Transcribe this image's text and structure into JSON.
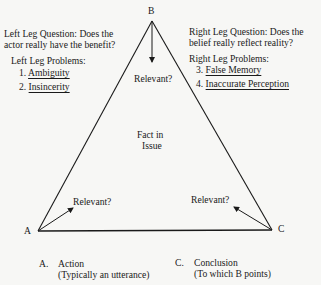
{
  "vertices": {
    "b": "B",
    "a": "A",
    "c": "C"
  },
  "left_leg": {
    "question_line1": "Left Leg Question:  Does the",
    "question_line2": "actor really have the benefit?",
    "problems_heading": "Left Leg Problems:",
    "problems": [
      {
        "num": "1.",
        "label": "Ambiguity"
      },
      {
        "num": "2.",
        "label": "Insincerity"
      }
    ]
  },
  "right_leg": {
    "question_line1": "Right Leg Question:  Does the",
    "question_line2": "belief really reflect reality?",
    "problems_heading": "Right Leg Problems:",
    "problems": [
      {
        "num": "3.",
        "label": "False Memory"
      },
      {
        "num": "4.",
        "label": "Inaccurate Perception"
      }
    ]
  },
  "relevance_labels": {
    "top": "Relevant?",
    "left": "Relevant?",
    "right": "Relevant?"
  },
  "center": {
    "line1": "Fact in",
    "line2": "Issue"
  },
  "legend": {
    "a": {
      "key": "A.",
      "line1": "Action",
      "line2": "(Typically an utterance)"
    },
    "c": {
      "key": "C.",
      "line1": "Conclusion",
      "line2": "(To which B points)"
    }
  }
}
